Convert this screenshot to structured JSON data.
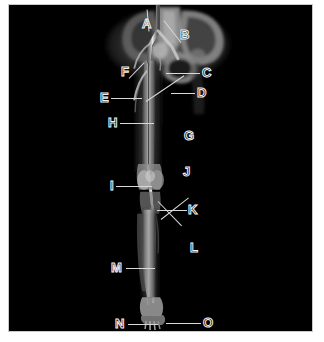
{
  "figure": {
    "kind": "radiograph-figure",
    "modality": "angiogram",
    "body_region": "lower-limb",
    "background_color": "#000000",
    "page_color": "#ffffff",
    "label_color": "#f2f2f2",
    "leader_color": "#d8d8d8",
    "frame": {
      "x": 8,
      "y": 4,
      "width": 305,
      "height": 328
    }
  },
  "labels": [
    {
      "id": "A",
      "text": "A",
      "x": 133,
      "y": 12,
      "lead": {
        "x": 140,
        "y": 26,
        "len": 22,
        "angle": 95
      }
    },
    {
      "id": "B",
      "text": "B",
      "x": 171,
      "y": 23,
      "lead": {
        "x": 172,
        "y": 37,
        "len": 28,
        "angle": 128
      }
    },
    {
      "id": "C",
      "text": "C",
      "x": 193,
      "y": 61,
      "lead": {
        "x": 157,
        "y": 68,
        "len": 34,
        "angle": 0
      }
    },
    {
      "id": "D",
      "text": "D",
      "x": 188,
      "y": 81,
      "lead": {
        "x": 162,
        "y": 88,
        "len": 24,
        "angle": 0
      }
    },
    {
      "id": "E",
      "text": "E",
      "x": 91,
      "y": 86,
      "lead": {
        "x": 102,
        "y": 93,
        "len": 31,
        "angle": 0
      }
    },
    {
      "id": "F",
      "text": "F",
      "x": 112,
      "y": 60,
      "lead": {
        "x": 120,
        "y": 73,
        "len": 22,
        "angle": 46
      }
    },
    {
      "id": "G",
      "text": "G",
      "x": 175,
      "y": 124,
      "lead": {
        "x": 137,
        "y": 96,
        "len": 46,
        "angle": 34
      }
    },
    {
      "id": "H",
      "text": "H",
      "x": 99,
      "y": 111,
      "lead": {
        "x": 111,
        "y": 118,
        "len": 34,
        "angle": 0
      }
    },
    {
      "id": "I",
      "text": "I",
      "x": 101,
      "y": 174,
      "lead": {
        "x": 107,
        "y": 181,
        "len": 36,
        "angle": 0
      }
    },
    {
      "id": "J",
      "text": "J",
      "x": 174,
      "y": 160,
      "lead": {
        "x": 149,
        "y": 196,
        "len": 34,
        "angle": -46
      }
    },
    {
      "id": "K",
      "text": "K",
      "x": 179,
      "y": 198,
      "lead": {
        "x": 148,
        "y": 205,
        "len": 30,
        "angle": 0
      }
    },
    {
      "id": "L",
      "text": "L",
      "x": 181,
      "y": 236,
      "lead": {
        "x": 152,
        "y": 214,
        "len": 35,
        "angle": 38
      }
    },
    {
      "id": "M",
      "text": "M",
      "x": 102,
      "y": 256,
      "lead": {
        "x": 117,
        "y": 263,
        "len": 29,
        "angle": 0
      }
    },
    {
      "id": "N",
      "text": "N",
      "x": 106,
      "y": 312,
      "lead": {
        "x": 119,
        "y": 319,
        "len": 30,
        "angle": 0
      }
    },
    {
      "id": "O",
      "text": "O",
      "x": 194,
      "y": 311,
      "lead": {
        "x": 157,
        "y": 318,
        "len": 35,
        "angle": 0
      }
    }
  ]
}
